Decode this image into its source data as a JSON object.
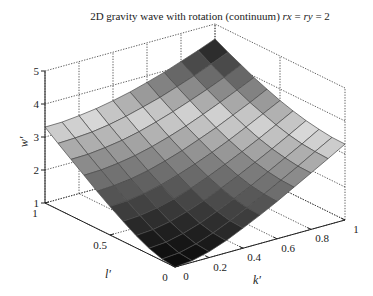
{
  "chart_data": {
    "type": "surface",
    "title": "2D gravity wave with rotation (continuum) rx = ry = 2",
    "title_parts": [
      {
        "text": "2D gravity wave with rotation (continuum) ",
        "italic": false
      },
      {
        "text": "rx",
        "italic": true
      },
      {
        "text": " = ",
        "italic": false
      },
      {
        "text": "ry",
        "italic": true
      },
      {
        "text": " = 2",
        "italic": false
      }
    ],
    "xlabel": "k′",
    "ylabel": "l′",
    "zlabel": "w′",
    "x_ticks": [
      0,
      0.2,
      0.4,
      0.6,
      0.8,
      1
    ],
    "x_tick_labels": [
      "0",
      "0.2",
      "0.4",
      "0.6",
      "0.8",
      "1"
    ],
    "y_ticks": [
      0,
      0.5,
      1
    ],
    "y_tick_labels": [
      "0",
      "0.5",
      "1"
    ],
    "z_ticks": [
      1,
      2,
      3,
      4,
      5
    ],
    "z_tick_labels": [
      "1",
      "2",
      "3",
      "4",
      "5"
    ],
    "xlim": [
      0,
      1
    ],
    "ylim": [
      0,
      1
    ],
    "zlim": [
      1,
      5
    ],
    "grid": true,
    "colormap": "gray",
    "x": [
      0,
      0.1,
      0.2,
      0.3,
      0.4,
      0.5,
      0.6,
      0.7,
      0.8,
      0.9,
      1
    ],
    "y": [
      0,
      0.1,
      0.2,
      0.3,
      0.4,
      0.5,
      0.6,
      0.7,
      0.8,
      0.9,
      1
    ],
    "z": [
      [
        1.0,
        1.05,
        1.18,
        1.37,
        1.61,
        1.86,
        2.13,
        2.42,
        2.71,
        3.0,
        3.3
      ],
      [
        1.05,
        1.09,
        1.22,
        1.41,
        1.64,
        1.89,
        2.16,
        2.44,
        2.72,
        3.02,
        3.31
      ],
      [
        1.18,
        1.22,
        1.34,
        1.51,
        1.73,
        1.97,
        2.22,
        2.5,
        2.78,
        3.06,
        3.36
      ],
      [
        1.37,
        1.41,
        1.51,
        1.67,
        1.86,
        2.09,
        2.33,
        2.59,
        2.86,
        3.14,
        3.43
      ],
      [
        1.61,
        1.64,
        1.73,
        1.86,
        2.04,
        2.25,
        2.48,
        2.72,
        2.98,
        3.25,
        3.53
      ],
      [
        1.86,
        1.89,
        1.97,
        2.09,
        2.25,
        2.44,
        2.65,
        2.88,
        3.13,
        3.39,
        3.65
      ],
      [
        2.13,
        2.16,
        2.22,
        2.33,
        2.48,
        2.65,
        2.85,
        3.06,
        3.3,
        3.54,
        3.8
      ],
      [
        2.42,
        2.44,
        2.5,
        2.59,
        2.72,
        2.88,
        3.06,
        3.27,
        3.49,
        3.72,
        3.96
      ],
      [
        2.71,
        2.72,
        2.78,
        2.86,
        2.98,
        3.13,
        3.3,
        3.49,
        3.69,
        3.91,
        4.15
      ],
      [
        3.0,
        3.02,
        3.06,
        3.14,
        3.25,
        3.39,
        3.54,
        3.72,
        3.91,
        4.12,
        4.34
      ],
      [
        3.3,
        3.31,
        3.36,
        3.43,
        3.53,
        3.65,
        3.8,
        3.96,
        4.15,
        4.34,
        4.55
      ]
    ]
  }
}
